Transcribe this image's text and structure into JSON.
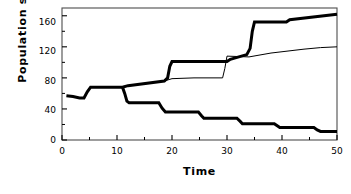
{
  "chart_data": {
    "type": "line",
    "title": "",
    "xlabel": "Time",
    "ylabel": "Population  size",
    "xlim": [
      0,
      50
    ],
    "ylim": [
      0,
      170
    ],
    "xticks": [
      0,
      10,
      20,
      30,
      40,
      50
    ],
    "yticks": [
      0,
      40,
      80,
      120,
      160
    ],
    "xminor_step": 5,
    "yminor_step": 20,
    "grid": false,
    "legend": null,
    "frame": "box",
    "series": [
      {
        "name": "upper-thick-line",
        "style": "thick",
        "linewidth": 3.0,
        "color": "#000000",
        "points": [
          [
            0.8,
            57
          ],
          [
            2.0,
            56
          ],
          [
            3.2,
            54
          ],
          [
            4.0,
            54
          ],
          [
            4.6,
            62
          ],
          [
            5.2,
            68
          ],
          [
            11.0,
            68
          ],
          [
            12.0,
            70
          ],
          [
            18.6,
            76
          ],
          [
            19.2,
            80
          ],
          [
            19.6,
            95
          ],
          [
            20.0,
            101
          ],
          [
            26.0,
            101
          ],
          [
            30.0,
            101
          ],
          [
            30.6,
            104
          ],
          [
            33.6,
            110
          ],
          [
            34.2,
            118
          ],
          [
            34.6,
            140
          ],
          [
            35.0,
            152
          ],
          [
            40.8,
            152
          ],
          [
            41.4,
            155
          ],
          [
            50.0,
            162
          ]
        ]
      },
      {
        "name": "middle-thin-line",
        "style": "thin",
        "linewidth": 1.0,
        "color": "#000000",
        "points": [
          [
            11.0,
            68
          ],
          [
            12.0,
            70
          ],
          [
            18.6,
            76
          ],
          [
            20.0,
            79
          ],
          [
            24.0,
            80
          ],
          [
            29.2,
            80
          ],
          [
            29.6,
            92
          ],
          [
            30.0,
            108
          ],
          [
            34.0,
            107
          ],
          [
            38.0,
            112
          ],
          [
            44.0,
            117
          ],
          [
            47.0,
            119
          ],
          [
            50.0,
            120
          ]
        ]
      },
      {
        "name": "lower-thick-line",
        "style": "thick",
        "linewidth": 3.0,
        "color": "#000000",
        "points": [
          [
            11.0,
            68
          ],
          [
            11.4,
            60
          ],
          [
            11.8,
            50
          ],
          [
            12.2,
            48
          ],
          [
            17.6,
            48
          ],
          [
            18.2,
            41
          ],
          [
            18.8,
            36
          ],
          [
            24.8,
            36
          ],
          [
            25.4,
            31
          ],
          [
            25.8,
            28
          ],
          [
            31.8,
            28
          ],
          [
            32.4,
            24
          ],
          [
            32.8,
            21
          ],
          [
            38.6,
            21
          ],
          [
            39.2,
            18
          ],
          [
            39.6,
            16
          ],
          [
            45.8,
            16
          ],
          [
            46.4,
            13
          ],
          [
            47.0,
            11
          ],
          [
            50.0,
            11
          ]
        ]
      }
    ]
  },
  "axes": {
    "ylabel_text": "Population  size",
    "xlabel_text": "Time",
    "ytick_labels": [
      "160",
      "120",
      "80",
      "40",
      "0"
    ],
    "xtick_labels": [
      "0",
      "10",
      "20",
      "30",
      "40",
      "50"
    ]
  },
  "colors": {
    "background": "#ffffff",
    "foreground": "#000000",
    "frame": "#4d4d4d"
  }
}
